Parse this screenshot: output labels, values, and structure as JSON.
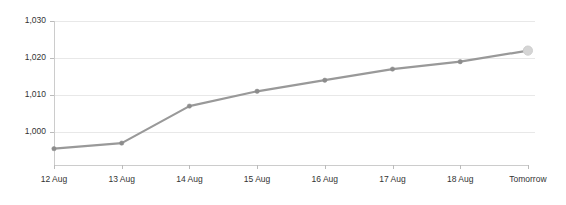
{
  "chart_data": {
    "type": "line",
    "title": "",
    "subtitle": "",
    "xlabel": "",
    "ylabel": "",
    "categories": [
      "12 Aug",
      "13 Aug",
      "14 Aug",
      "15 Aug",
      "16 Aug",
      "17 Aug",
      "18 Aug",
      "Tomorrow"
    ],
    "values": [
      995.5,
      997,
      1007,
      1011,
      1014,
      1017,
      1019,
      1022
    ],
    "series": [
      {
        "name": "",
        "values": [
          995.5,
          997,
          1007,
          1011,
          1014,
          1017,
          1019,
          1022
        ]
      }
    ],
    "ylim": [
      990,
      1030
    ],
    "y_ticks": [
      1000,
      1010,
      1020,
      1030
    ],
    "y_tick_labels": [
      "1,000",
      "1,010",
      "1,020",
      "1,030"
    ],
    "x_tick_labels": [
      "12 Aug",
      "13 Aug",
      "14 Aug",
      "15 Aug",
      "16 Aug",
      "17 Aug",
      "18 Aug",
      "Tomorrow"
    ],
    "grid": true,
    "grid_axis": "y",
    "legend": false,
    "legend_position": "none",
    "annotations": [
      {
        "point_index": 7,
        "label": "Tomorrow",
        "note": "forecast point rendered with larger light-gray marker"
      }
    ],
    "colors": {
      "line": "#999999",
      "marker": "#8c8c8c",
      "forecast_marker": "#d5d5d5",
      "grid": "#e8e8e8",
      "axis": "#cccccc",
      "tick_text": "#333333",
      "background": "#ffffff"
    }
  }
}
